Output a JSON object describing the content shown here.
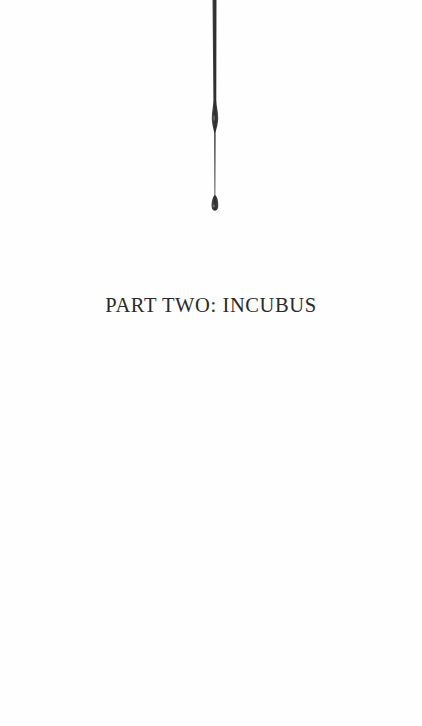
{
  "page": {
    "part_title": "PART TWO: INCUBUS",
    "ornament": "ink-drip-icon",
    "colors": {
      "background": "#fefefe",
      "text": "#2a2a2a",
      "ink": "#2b2b2b"
    }
  }
}
